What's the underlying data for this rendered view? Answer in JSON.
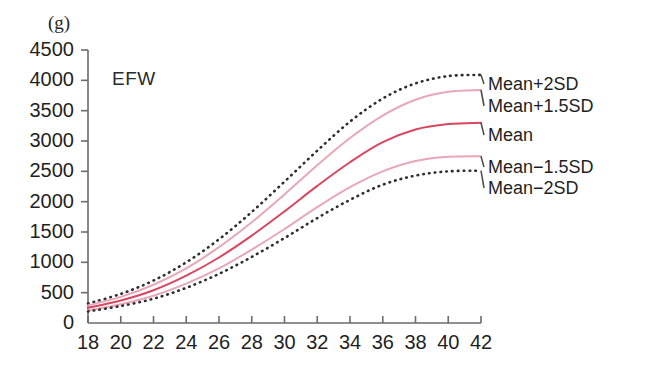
{
  "chart_data": {
    "type": "line",
    "title": "",
    "series_label": "EFW",
    "xlabel": "",
    "ylabel": "",
    "yunit": "(g)",
    "xlim": [
      18,
      42
    ],
    "ylim": [
      0,
      4500
    ],
    "grid": false,
    "legend_position": "right-inline",
    "xticks": [
      18,
      20,
      22,
      24,
      26,
      28,
      30,
      32,
      34,
      36,
      38,
      40,
      42
    ],
    "yticks": [
      0,
      500,
      1000,
      1500,
      2000,
      2500,
      3000,
      3500,
      4000,
      4500
    ],
    "x": [
      18,
      20,
      22,
      24,
      26,
      28,
      30,
      32,
      34,
      36,
      38,
      40,
      42
    ],
    "series": [
      {
        "name": "Mean+2SD",
        "style": "dotted",
        "color": "#2e2e2e",
        "values": [
          320,
          480,
          700,
          1000,
          1380,
          1830,
          2330,
          2840,
          3320,
          3700,
          3950,
          4070,
          4090
        ]
      },
      {
        "name": "Mean+1.5SD",
        "style": "solid",
        "color": "#e8a7b8",
        "values": [
          290,
          430,
          630,
          900,
          1250,
          1660,
          2120,
          2600,
          3050,
          3420,
          3680,
          3810,
          3840
        ]
      },
      {
        "name": "Mean",
        "style": "solid",
        "color": "#d9465f",
        "values": [
          250,
          370,
          540,
          780,
          1080,
          1440,
          1840,
          2260,
          2650,
          2980,
          3190,
          3280,
          3300
        ]
      },
      {
        "name": "Mean−1.5SD",
        "style": "solid",
        "color": "#e8a7b8",
        "values": [
          210,
          310,
          450,
          650,
          900,
          1210,
          1550,
          1910,
          2240,
          2500,
          2670,
          2740,
          2750
        ]
      },
      {
        "name": "Mean−2SD",
        "style": "dotted",
        "color": "#2e2e2e",
        "values": [
          190,
          280,
          400,
          580,
          810,
          1090,
          1400,
          1730,
          2030,
          2280,
          2430,
          2500,
          2510
        ]
      }
    ],
    "legend_entries": [
      {
        "label": "Mean+2SD",
        "y_value": 4090
      },
      {
        "label": "Mean+1.5SD",
        "y_value": 3840
      },
      {
        "label": "Mean",
        "y_value": 3300
      },
      {
        "label": "Mean−1.5SD",
        "y_value": 2750
      },
      {
        "label": "Mean−2SD",
        "y_value": 2510
      }
    ]
  },
  "colors": {
    "background": "#ffffff",
    "axis": "#6b6b6b",
    "text": "#1f1f1f",
    "dotted_series": "#2e2e2e",
    "sd_band": "#e8a7b8",
    "mean_line": "#d9465f",
    "leader_line": "#4a4a4a"
  }
}
